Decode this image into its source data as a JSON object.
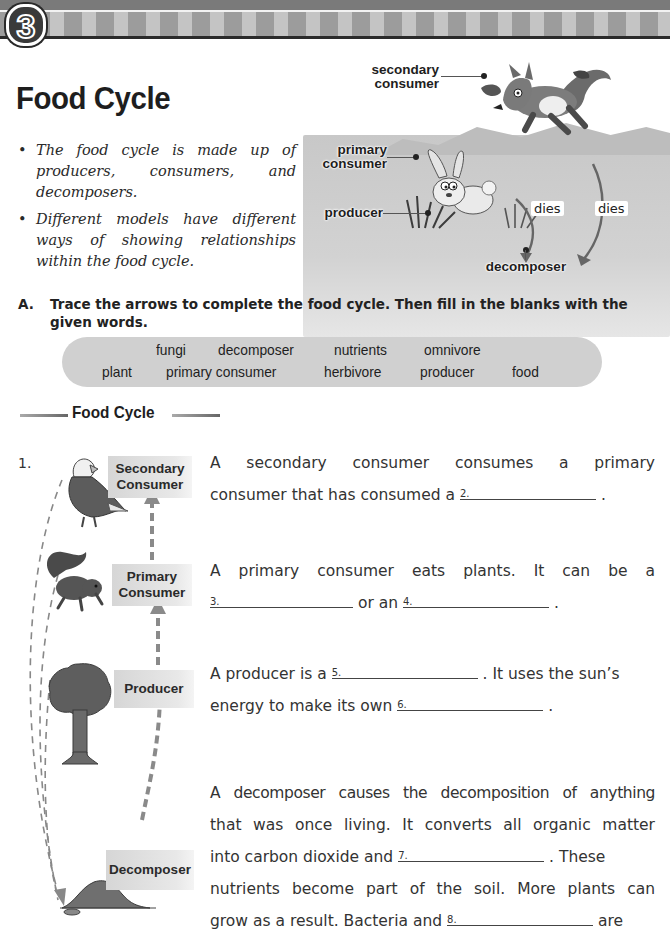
{
  "header": {
    "unit_number": "3"
  },
  "page": {
    "title": "Food Cycle",
    "bullets": [
      "The food cycle is made up of producers, consumers, and decomposers.",
      "Different models have different ways of showing relationships within the food cycle."
    ]
  },
  "illustration": {
    "labels": {
      "secondary_consumer": "secondary consumer",
      "secondary_consumer_l1": "secondary",
      "secondary_consumer_l2": "consumer",
      "primary_consumer_l1": "primary",
      "primary_consumer_l2": "consumer",
      "producer": "producer",
      "dies_1": "dies",
      "dies_2": "dies",
      "decomposer": "decomposer"
    },
    "icons": [
      "fox-icon",
      "squirrel-icon",
      "rabbit-icon",
      "grass-icon"
    ]
  },
  "section_a": {
    "letter": "A.",
    "instruction": "Trace the arrows to complete the food cycle.  Then fill in the blanks with the given words.",
    "word_bank": {
      "row1": [
        "fungi",
        "decomposer",
        "nutrients",
        "omnivore"
      ],
      "row2": [
        "plant",
        "primary consumer",
        "herbivore",
        "producer",
        "food"
      ]
    }
  },
  "diagram": {
    "subheading": "Food Cycle",
    "question_number": "1.",
    "nodes": [
      {
        "label_l1": "Secondary",
        "label_l2": "Consumer",
        "icon": "eagle-icon"
      },
      {
        "label_l1": "Primary",
        "label_l2": "Consumer",
        "icon": "squirrel-icon"
      },
      {
        "label_l1": "Producer",
        "label_l2": "",
        "icon": "tree-icon"
      },
      {
        "label_l1": "Decomposer",
        "label_l2": "",
        "icon": "soil-mound-icon"
      }
    ]
  },
  "paragraphs": {
    "p1": {
      "line1": "A secondary consumer consumes a primary",
      "line2_pre": "consumer that has consumed a",
      "blank2": "2.",
      "line2_post": "."
    },
    "p2": {
      "line1": "A primary consumer eats plants.  It can be a",
      "blank3": "3.",
      "mid": "or an",
      "blank4": "4.",
      "end": "."
    },
    "p3": {
      "pre": "A producer is a",
      "blank5": "5.",
      "mid": ".  It uses the sun’s",
      "line2_pre": "energy to make its own",
      "blank6": "6.",
      "end": "."
    },
    "p4": {
      "line1": "A decomposer causes the decomposition of anything",
      "line2": "that was once living.  It converts all organic matter",
      "line3_pre": "into carbon dioxide and",
      "blank7": "7.",
      "line3_post": ".  These",
      "line4": "nutrients become part of the soil.  More plants can",
      "line5_pre": "grow as a result.  Bacteria and",
      "blank8": "8.",
      "line5_post": "are"
    }
  },
  "colors": {
    "header_dark": "#7a7a7a",
    "stripe_dark": "#9c9c9c",
    "stripe_light": "#c4c4c4",
    "word_bank_bg": "#d0d0d0",
    "label_bg": "#dcdcdc",
    "arrow": "#8a8a8a"
  }
}
